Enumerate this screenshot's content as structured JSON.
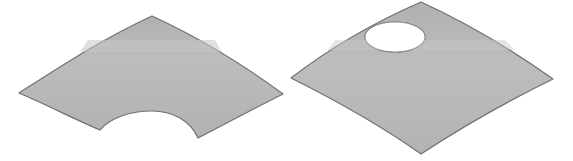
{
  "figure": {
    "colors": {
      "background": "#ffffff",
      "surface_fill": "#b4b4b4",
      "surface_highlight": "#c2c2c2",
      "surface_edge": "#6e6e6e",
      "hole_fill": "#ffffff"
    },
    "panels": [
      {
        "id": "left",
        "name": "annular sector panel",
        "shape": "curved fan / annular sector with concave inner edge"
      },
      {
        "id": "right",
        "name": "curved square panel with hole",
        "shape": "doubly-curved quadrilateral with elliptical cutout"
      }
    ]
  }
}
